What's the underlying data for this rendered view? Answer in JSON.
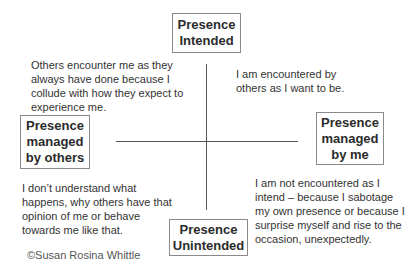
{
  "boxes": {
    "top": {
      "line1": "Presence",
      "line2": "Intended"
    },
    "left": {
      "line1": "Presence",
      "line2": "managed",
      "line3": "by others"
    },
    "right": {
      "line1": "Presence",
      "line2": "managed",
      "line3": "by me"
    },
    "bottom": {
      "line1": "Presence",
      "line2": "Unintended"
    }
  },
  "quadrants": {
    "top_left": [
      "Others encounter me as they",
      "always have done because I",
      "collude with how they expect to",
      "experience me."
    ],
    "top_right": [
      "I am encountered by",
      "others as I want to be."
    ],
    "bottom_left": [
      "I don’t understand what",
      "happens, why others have that",
      "opinion of me or behave",
      "towards me like that."
    ],
    "bottom_right": [
      "I am not encountered  as  I",
      "intend – because I sabotage",
      "my own presence  or because I",
      "surprise myself and rise to the",
      "occasion, unexpectedly."
    ]
  },
  "copyright": "©Susan Rosina Whittle",
  "colors": {
    "axis": "#555555",
    "box_border": "#8a8a8a",
    "text": "#333333"
  }
}
